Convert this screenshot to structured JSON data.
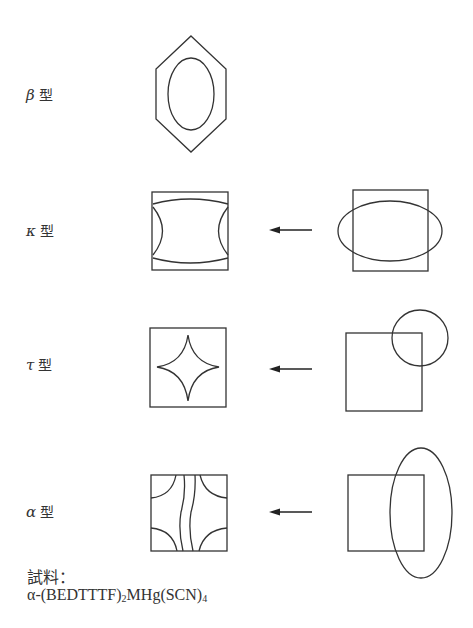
{
  "rows": [
    {
      "id": "beta",
      "greek": "β",
      "suffix": "型",
      "label_pos": {
        "x": 26,
        "y": 88
      }
    },
    {
      "id": "kappa",
      "greek": "κ",
      "suffix": "型",
      "label_pos": {
        "x": 26,
        "y": 225
      }
    },
    {
      "id": "tau",
      "greek": "τ",
      "suffix": "型",
      "label_pos": {
        "x": 26,
        "y": 358
      }
    },
    {
      "id": "alpha",
      "greek": "α",
      "suffix": "型",
      "label_pos": {
        "x": 26,
        "y": 505
      }
    }
  ],
  "caption": {
    "title": "試料：",
    "formula_prefix": "α-(BEDTTTF)",
    "formula_sub1": "2",
    "formula_mid": "MHg(SCN)",
    "formula_sub2": "4"
  },
  "colors": {
    "stroke": "#333333",
    "background": "#ffffff"
  }
}
